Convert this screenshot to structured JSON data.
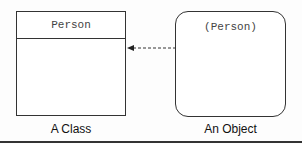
{
  "diagram": {
    "class_box": {
      "name": "Person",
      "caption": "A Class"
    },
    "object_box": {
      "name": "(Person)",
      "caption": "An Object"
    },
    "relation": {
      "type": "dashed-arrow",
      "from": "object_box",
      "to": "class_box"
    }
  }
}
